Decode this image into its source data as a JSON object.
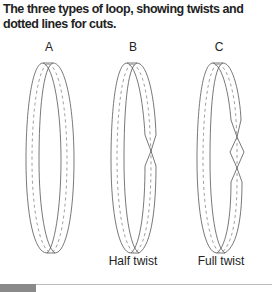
{
  "caption": "The three types of loop, showing twists and dotted lines for cuts.",
  "loops": [
    {
      "id": "A",
      "label": "A",
      "twist_label": "",
      "half_twists": 0
    },
    {
      "id": "B",
      "label": "B",
      "twist_label": "Half twist",
      "half_twists": 1
    },
    {
      "id": "C",
      "label": "C",
      "twist_label": "Full twist",
      "half_twists": 2
    }
  ],
  "colors": {
    "outline": "#555555",
    "dashes": "#777777",
    "footer_bar": "#8a8a8a"
  }
}
